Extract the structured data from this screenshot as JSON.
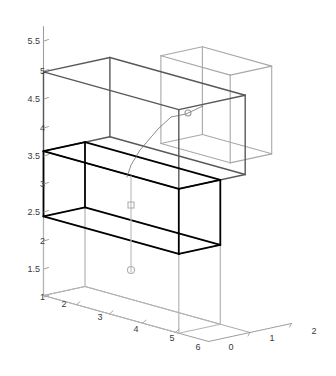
{
  "figure": {
    "title": "",
    "background_color": "#ffffff",
    "width": 336,
    "height": 376,
    "projection": "3d-axonometric"
  },
  "chart_data": {
    "type": "line",
    "title": "",
    "xlabel": "",
    "ylabel": "",
    "zlabel": "",
    "grid": false,
    "legend": null,
    "projection": "3d wireframe cuboids",
    "axes": {
      "vertical_axis": {
        "name": "z",
        "ticks": [
          1,
          1.5,
          2,
          2.5,
          3,
          3.5,
          4,
          4.5,
          5,
          5.5
        ],
        "tick_labels": [
          "1",
          "1.5",
          "2",
          "2.5",
          "3",
          "3.5",
          "4",
          "4.5",
          "5",
          "5.5"
        ],
        "range": [
          1,
          5.75
        ]
      },
      "left_depth_axis": {
        "name": "x",
        "ticks": [
          1,
          2,
          3,
          4,
          5,
          6
        ],
        "tick_labels": [
          "1",
          "2",
          "3",
          "4",
          "5",
          "6"
        ],
        "range": [
          1,
          6
        ]
      },
      "right_depth_axis": {
        "name": "y",
        "ticks": [
          0,
          1,
          2
        ],
        "tick_labels": [
          "0",
          "1",
          "2"
        ],
        "range": [
          0,
          2
        ]
      }
    },
    "series": [
      {
        "name": "box-bottom-light",
        "color": "#b4b4b4",
        "line_width": 1.2,
        "z_bottom": 1.0,
        "z_top": 2.4,
        "x_range": [
          1,
          5.1
        ],
        "y_range": [
          0,
          1.0
        ]
      },
      {
        "name": "box-middle-black",
        "color": "#000000",
        "line_width": 1.8,
        "z_bottom": 2.4,
        "z_top": 3.55,
        "x_range": [
          1,
          5.1
        ],
        "y_range": [
          0,
          1.0
        ]
      },
      {
        "name": "box-upper-darkgray",
        "color": "#585858",
        "line_width": 1.4,
        "z_bottom": 3.55,
        "z_top": 4.95,
        "x_range": [
          1,
          5.1
        ],
        "y_range": [
          0,
          1.6
        ]
      },
      {
        "name": "box-topright-lightgray",
        "color": "#a8a8a8",
        "line_width": 1.1,
        "z_bottom": 3.9,
        "z_top": 5.45,
        "x_range": [
          3.3,
          5.4
        ],
        "y_range": [
          1.0,
          2.0
        ]
      }
    ],
    "connector_polyline": {
      "name": "connector-path",
      "color": "#6e6e6e",
      "line_width": 0.8,
      "points_px": [
        [
          203,
          106
        ],
        [
          186,
          114
        ],
        [
          171,
          117
        ],
        [
          158,
          129
        ],
        [
          140,
          150
        ],
        [
          131,
          165
        ],
        [
          127,
          177
        ]
      ]
    },
    "markers": [
      {
        "name": "marker-circle-upper",
        "shape": "circle",
        "x_px": 188,
        "y_px": 113,
        "radius_px": 3,
        "color": "#9a9a9a"
      },
      {
        "name": "marker-square-mid",
        "shape": "square",
        "x_px": 131,
        "y_px": 205,
        "size_px": 6,
        "color": "#b0b0b0"
      },
      {
        "name": "marker-circle-lower",
        "shape": "circle",
        "x_px": 131,
        "y_px": 270,
        "radius_px": 3.5,
        "color": "#b0b0b0"
      }
    ],
    "vertical_dropline": {
      "name": "vertical-dropline",
      "color": "#c0c0c0",
      "line_width": 1.2,
      "x_px": 131,
      "y_top_px": 176,
      "y_bottom_px": 272
    }
  },
  "axis_ticks": {
    "z": [
      {
        "label": "5.5",
        "x": 31,
        "y": 41
      },
      {
        "label": "5",
        "x": 36,
        "y": 71
      },
      {
        "label": "4.5",
        "x": 31,
        "y": 99
      },
      {
        "label": "4",
        "x": 36,
        "y": 128
      },
      {
        "label": "3.5",
        "x": 31,
        "y": 156
      },
      {
        "label": "3",
        "x": 36,
        "y": 184
      },
      {
        "label": "2.5",
        "x": 31,
        "y": 212
      },
      {
        "label": "2",
        "x": 36,
        "y": 241
      },
      {
        "label": "1.5",
        "x": 31,
        "y": 269
      },
      {
        "label": "1",
        "x": 36,
        "y": 297
      }
    ],
    "x_left": [
      {
        "label": "2",
        "x": 64,
        "y": 307
      },
      {
        "label": "3",
        "x": 100,
        "y": 320
      },
      {
        "label": "4",
        "x": 136,
        "y": 332
      },
      {
        "label": "5",
        "x": 172,
        "y": 341
      },
      {
        "label": "6",
        "x": 198,
        "y": 350
      }
    ],
    "y_right": [
      {
        "label": "0",
        "x": 231,
        "y": 350
      },
      {
        "label": "1",
        "x": 272,
        "y": 341
      },
      {
        "label": "2",
        "x": 314,
        "y": 334
      }
    ]
  },
  "colors": {
    "axis_line": "#9e9e9e",
    "tick_text": "#3a3a3a",
    "black_box": "#000000",
    "dark_gray_box": "#585858",
    "light_gray_box": "#b4b4b4",
    "pale_gray_box": "#a8a8a8",
    "background": "#ffffff"
  }
}
